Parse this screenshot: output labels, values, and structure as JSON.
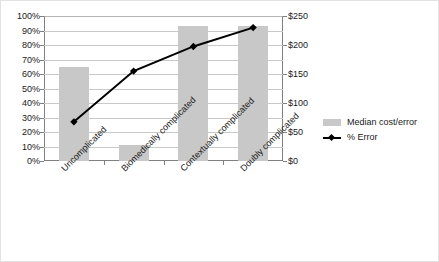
{
  "chart_data": {
    "type": "bar",
    "title": "",
    "xlabel": "",
    "ylabel": "",
    "grid": true,
    "legend_position": "right",
    "categories": [
      "Uncomplicated",
      "Biomedically complicated",
      "Contextually complicated",
      "Doubly complicated"
    ],
    "left_axis": {
      "label": "",
      "ylim": [
        0,
        100
      ],
      "tick_labels": [
        "0%",
        "10%",
        "20%",
        "30%",
        "40%",
        "50%",
        "60%",
        "70%",
        "80%",
        "90%",
        "100%"
      ],
      "tick_values": [
        0,
        10,
        20,
        30,
        40,
        50,
        60,
        70,
        80,
        90,
        100
      ]
    },
    "right_axis": {
      "label": "",
      "ylim": [
        0,
        250
      ],
      "tick_labels": [
        "$0",
        "$50",
        "$100",
        "$150",
        "$200",
        "$250"
      ],
      "tick_values": [
        0,
        50,
        100,
        150,
        200,
        250
      ]
    },
    "series": [
      {
        "name": "Median cost/error",
        "type": "bar",
        "axis": "right",
        "color": "#c8c8c8",
        "values": [
          162,
          28,
          232,
          232
        ],
        "values_percent_scale": [
          65,
          11,
          93,
          93
        ]
      },
      {
        "name": "% Error",
        "type": "line",
        "axis": "left",
        "color": "#000000",
        "marker": "diamond",
        "values": [
          27,
          62,
          79,
          92
        ]
      }
    ]
  },
  "legend": {
    "items": [
      {
        "label": "Median cost/error",
        "marker": "swatch"
      },
      {
        "label": "% Error",
        "marker": "line-diamond"
      }
    ]
  }
}
